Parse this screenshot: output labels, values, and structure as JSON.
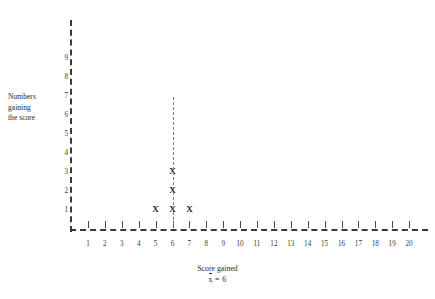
{
  "chart_data": {
    "type": "bar",
    "title": "",
    "subtitle": "",
    "xlabel": "Score gained",
    "ylabel": "Numbers gaining the score",
    "ylabel_lines": [
      "Numbers",
      "gaining",
      "the score"
    ],
    "categories": [
      1,
      2,
      3,
      4,
      5,
      6,
      7,
      8,
      9,
      10,
      11,
      12,
      13,
      14,
      15,
      16,
      17,
      18,
      19,
      20
    ],
    "values": [
      0,
      0,
      0,
      0,
      1,
      3,
      1,
      0,
      0,
      0,
      0,
      0,
      0,
      0,
      0,
      0,
      0,
      0,
      0,
      0
    ],
    "xtick_labels": [
      "1",
      "2",
      "3",
      "4",
      "5",
      "6",
      "7",
      "8",
      "9",
      "10",
      "11",
      "12",
      "13",
      "14",
      "15",
      "16",
      "17",
      "18",
      "19",
      "20"
    ],
    "ytick_labels": [
      "1",
      "2",
      "3",
      "4",
      "5",
      "6",
      "7",
      "8",
      "9"
    ],
    "ytick_values": [
      1,
      2,
      3,
      4,
      5,
      6,
      7,
      8,
      9
    ],
    "xlim": [
      0.4,
      20.6
    ],
    "ylim": [
      0,
      9.6
    ],
    "grid": false,
    "legend": null,
    "marker_glyph": "X",
    "annotations": [
      {
        "name": "mean-guide-line",
        "type": "vertical-dashed-line",
        "x": 6,
        "y_from": 0.2,
        "y_to": 7.0
      }
    ],
    "statistics": {
      "mean_symbol": "x",
      "mean_equals": "=",
      "mean_value": "6",
      "mean_text": "x̄ = 6"
    },
    "colors": {
      "background": "#ffffff",
      "axis": "#3a3a3a",
      "tick": "#4a4a4a",
      "guide_line": "#7c7c7c",
      "marker": "#262626",
      "text": "#2a2a2a"
    }
  },
  "captions": {
    "x_axis_title": "Score gained",
    "mean_prefix": "x",
    "mean_suffix": " = 6"
  }
}
